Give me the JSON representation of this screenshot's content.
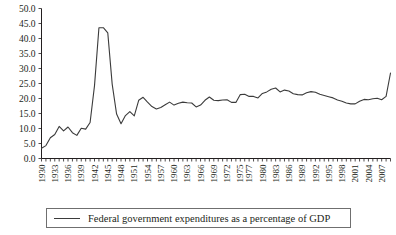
{
  "chart_data": {
    "type": "line",
    "title": "",
    "subtitle": "",
    "xlabel": "",
    "ylabel": "",
    "grid": false,
    "legend_position": "bottom",
    "ylim": [
      0.0,
      50.0
    ],
    "xlim": [
      1930,
      2009
    ],
    "ytick_labels": [
      "0.0",
      "5.0",
      "10.0",
      "15.0",
      "20.0",
      "25.0",
      "30.0",
      "35.0",
      "40.0",
      "45.0",
      "50.0"
    ],
    "ytick_values": [
      0.0,
      5.0,
      10.0,
      15.0,
      20.0,
      25.0,
      30.0,
      35.0,
      40.0,
      45.0,
      50.0
    ],
    "xtick_labels": [
      "1930",
      "1933",
      "1936",
      "1939",
      "1942",
      "1945",
      "1948",
      "1951",
      "1954",
      "1957",
      "1960",
      "1963",
      "1966",
      "1969",
      "1972",
      "1975",
      "1977",
      "1980",
      "1983",
      "1986",
      "1989",
      "1992",
      "1995",
      "1998",
      "2001",
      "2004",
      "2007"
    ],
    "xtick_values": [
      1930,
      1933,
      1936,
      1939,
      1942,
      1945,
      1948,
      1951,
      1954,
      1957,
      1960,
      1963,
      1966,
      1969,
      1972,
      1975,
      1977,
      1980,
      1983,
      1986,
      1989,
      1992,
      1995,
      1998,
      2001,
      2004,
      2007
    ],
    "series": [
      {
        "name": "Federal government expenditures as a percentage of GDP",
        "color": "#3b3b3b",
        "x": [
          1930,
          1931,
          1932,
          1933,
          1934,
          1935,
          1936,
          1937,
          1938,
          1939,
          1940,
          1941,
          1942,
          1943,
          1944,
          1945,
          1946,
          1947,
          1948,
          1949,
          1950,
          1951,
          1952,
          1953,
          1954,
          1955,
          1956,
          1957,
          1958,
          1959,
          1960,
          1961,
          1962,
          1963,
          1964,
          1965,
          1966,
          1967,
          1968,
          1969,
          1970,
          1971,
          1972,
          1973,
          1974,
          1975,
          1976,
          1977,
          1978,
          1979,
          1980,
          1981,
          1982,
          1983,
          1984,
          1985,
          1986,
          1987,
          1988,
          1989,
          1990,
          1991,
          1992,
          1993,
          1994,
          1995,
          1996,
          1997,
          1998,
          1999,
          2000,
          2001,
          2002,
          2003,
          2004,
          2005,
          2006,
          2007,
          2008,
          2009
        ],
        "y": [
          3.4,
          4.3,
          6.9,
          8.0,
          10.7,
          9.2,
          10.5,
          8.6,
          7.7,
          10.1,
          9.8,
          12.0,
          24.3,
          43.6,
          43.6,
          41.9,
          24.8,
          14.8,
          11.6,
          14.3,
          15.6,
          14.2,
          19.4,
          20.4,
          18.8,
          17.3,
          16.5,
          17.0,
          17.9,
          18.8,
          17.8,
          18.4,
          18.8,
          18.6,
          18.5,
          17.2,
          17.8,
          19.4,
          20.5,
          19.4,
          19.3,
          19.5,
          19.6,
          18.7,
          18.7,
          21.3,
          21.4,
          20.7,
          20.7,
          20.2,
          21.7,
          22.2,
          23.1,
          23.5,
          22.2,
          22.8,
          22.5,
          21.6,
          21.3,
          21.2,
          21.9,
          22.3,
          22.1,
          21.4,
          21.0,
          20.6,
          20.2,
          19.5,
          19.1,
          18.5,
          18.2,
          18.2,
          19.1,
          19.7,
          19.6,
          19.9,
          20.1,
          19.6,
          20.7,
          28.5
        ]
      }
    ]
  },
  "legend": {
    "entry_label": "Federal government expenditures as a percentage of GDP"
  }
}
